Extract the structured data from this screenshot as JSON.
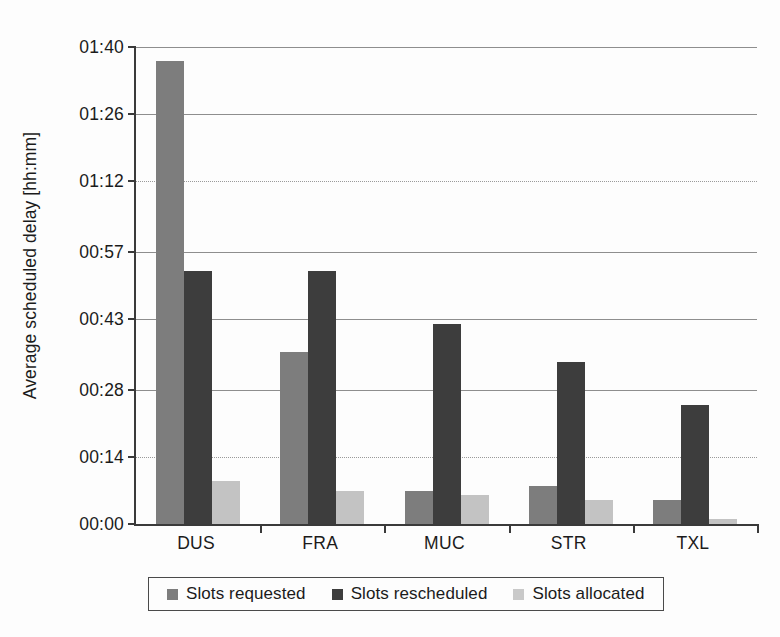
{
  "chart_data": {
    "type": "bar",
    "title": "",
    "xlabel": "",
    "ylabel": "Average scheduled delay [hh:mm]",
    "categories": [
      "DUS",
      "FRA",
      "MUC",
      "STR",
      "TXL"
    ],
    "ytick_labels": [
      "01:40",
      "01:26",
      "01:12",
      "00:57",
      "00:43",
      "00:28",
      "00:14",
      "00:00"
    ],
    "ytick_minutes": [
      100,
      86,
      72,
      57,
      43,
      28,
      14,
      0
    ],
    "ylim_minutes": [
      0,
      100
    ],
    "grid": true,
    "legend_position": "bottom",
    "series": [
      {
        "name": "Slots requested",
        "color": "#7d7d7d",
        "values_minutes": [
          97,
          36,
          7,
          8,
          5
        ],
        "values_hhmm": [
          "01:37",
          "00:36",
          "00:07",
          "00:08",
          "00:05"
        ]
      },
      {
        "name": "Slots rescheduled",
        "color": "#3d3d3d",
        "values_minutes": [
          53,
          53,
          42,
          34,
          25
        ],
        "values_hhmm": [
          "00:53",
          "00:53",
          "00:42",
          "00:34",
          "00:25"
        ]
      },
      {
        "name": "Slots allocated",
        "color": "#c3c3c3",
        "values_minutes": [
          9,
          7,
          6,
          5,
          1
        ],
        "values_hhmm": [
          "00:09",
          "00:07",
          "00:06",
          "00:05",
          "00:01"
        ]
      }
    ]
  },
  "legend": {
    "items": [
      {
        "label": "Slots requested"
      },
      {
        "label": "Slots rescheduled"
      },
      {
        "label": "Slots allocated"
      }
    ]
  },
  "colors": {
    "requested": "#7d7d7d",
    "rescheduled": "#3d3d3d",
    "allocated": "#c3c3c3",
    "axis": "#3a3a3a",
    "gridline": "#8e8e8e",
    "text": "#1b1b1b",
    "background": "#fdfdfd"
  }
}
